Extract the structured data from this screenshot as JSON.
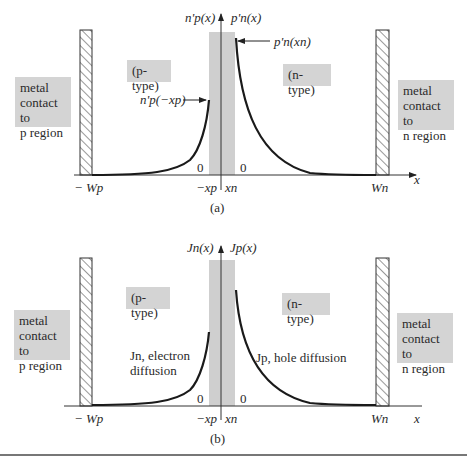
{
  "panels": [
    {
      "id": "a",
      "caption": "(a)",
      "y_axis_label_left": "n'p(x)",
      "y_axis_label_right": "p'n(x)",
      "x_axis_label": "x",
      "region_left": "(p-type)",
      "region_right": "(n-type)",
      "contact_left": [
        "metal",
        "contact to",
        "p region"
      ],
      "contact_right": [
        "metal",
        "contact to",
        "n region"
      ],
      "annotation_left": "n'p(−xp)",
      "annotation_right": "p'n(xn)",
      "zero_left": "0",
      "zero_right": "0",
      "tick_neg_wp": "− Wp",
      "tick_neg_xp": "−xp",
      "tick_xn": "xn",
      "tick_wn": "Wn"
    },
    {
      "id": "b",
      "caption": "(b)",
      "y_axis_label_left": "Jn(x)",
      "y_axis_label_right": "Jp(x)",
      "x_axis_label": "x",
      "region_left": "(p-type)",
      "region_right": "(n-type)",
      "contact_left": [
        "metal",
        "contact to",
        "p region"
      ],
      "contact_right": [
        "metal",
        "contact to",
        "n region"
      ],
      "curve_label_left": [
        "Jn, electron",
        "diffusion"
      ],
      "curve_label_right": "Jp, hole diffusion",
      "zero_left": "0",
      "zero_right": "0",
      "tick_neg_wp": "− Wp",
      "tick_neg_xp": "−xp",
      "tick_xn": "xn",
      "tick_wn": "Wn"
    }
  ],
  "colors": {
    "depletion_region": "#cfcfcf",
    "label_box": "#d4d4d4",
    "curve": "#1a1a1a"
  }
}
